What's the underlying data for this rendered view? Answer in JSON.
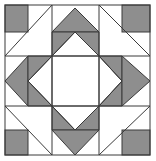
{
  "figure": {
    "colors": {
      "background": "#ffffff",
      "fill": "#8e8e8e",
      "stroke": "#3a3a3a"
    },
    "grid": {
      "x": [
        5,
        28,
        52,
        75,
        99,
        122,
        150
      ],
      "y": [
        5,
        32,
        56,
        81,
        106,
        130,
        155
      ]
    },
    "pieces": [
      {
        "name": "corner-square-top-left",
        "shape": "square",
        "fill": "grey"
      },
      {
        "name": "corner-square-top-right",
        "shape": "square",
        "fill": "grey"
      },
      {
        "name": "corner-square-bottom-left",
        "shape": "square",
        "fill": "grey"
      },
      {
        "name": "corner-square-bottom-right",
        "shape": "square",
        "fill": "grey"
      },
      {
        "name": "flying-geese-top",
        "shape": "triangle-up-pair",
        "fill": "grey"
      },
      {
        "name": "flying-geese-bottom",
        "shape": "triangle-down-pair",
        "fill": "grey"
      },
      {
        "name": "flying-geese-left",
        "shape": "triangle-left-pair",
        "fill": "grey"
      },
      {
        "name": "flying-geese-right",
        "shape": "triangle-right-pair",
        "fill": "grey"
      },
      {
        "name": "center-square",
        "shape": "square",
        "fill": "white"
      }
    ]
  }
}
